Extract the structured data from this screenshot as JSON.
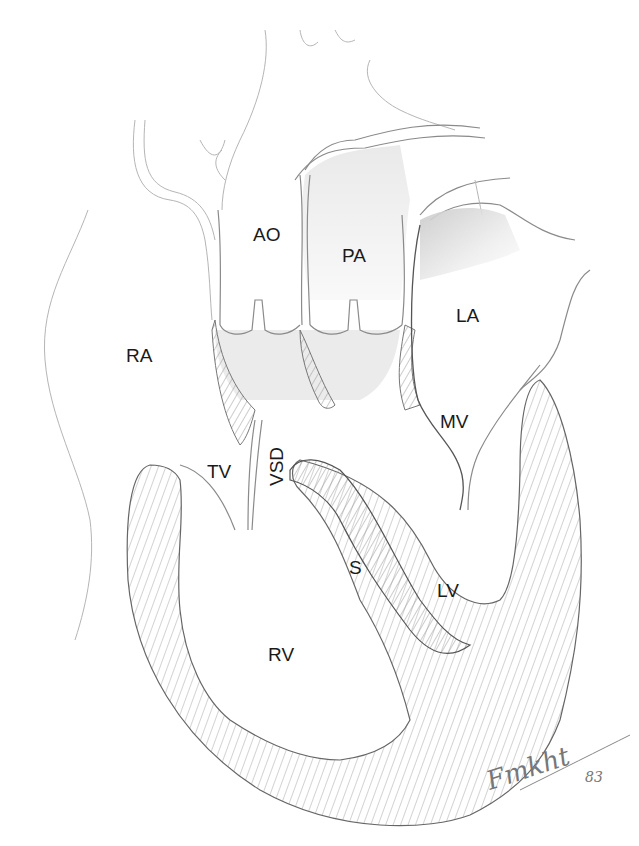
{
  "diagram": {
    "type": "anatomical-illustration",
    "labels": {
      "ao": "AO",
      "pa": "PA",
      "la": "LA",
      "ra": "RA",
      "mv": "MV",
      "tv": "TV",
      "vsd": "VSD",
      "s": "S",
      "lv": "LV",
      "rv": "RV"
    },
    "signature": {
      "name": "Fmkht",
      "year": "83"
    }
  }
}
